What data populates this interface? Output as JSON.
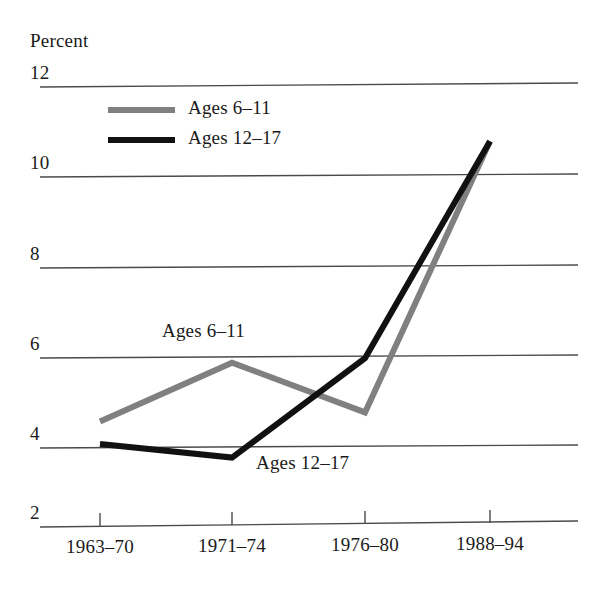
{
  "chart_data": {
    "type": "line",
    "title": "",
    "subtitle": "",
    "xlabel": "",
    "ylabel": "Percent",
    "categories": [
      "1963–70",
      "1971–74",
      "1976–80",
      "1988–94"
    ],
    "ylim": [
      2,
      12
    ],
    "yticks": [
      12,
      10,
      8,
      6,
      4,
      2
    ],
    "ytick_labels": [
      "12",
      "10",
      "8",
      "6",
      "4",
      "2"
    ],
    "grid": true,
    "grid_orientation": "horizontal",
    "legend_position": "top-left-inside",
    "series": [
      {
        "name": "Ages 6–11",
        "color": "#808080",
        "values": [
          4.6,
          5.9,
          4.8,
          10.8
        ]
      },
      {
        "name": "Ages 12–17",
        "color": "#111111",
        "values": [
          4.1,
          3.8,
          6.0,
          10.8
        ]
      }
    ],
    "annotations": [
      {
        "text": "Ages 6–11",
        "series": "Ages 6–11"
      },
      {
        "text": "Ages 12–17",
        "series": "Ages 12–17"
      }
    ]
  },
  "axis": {
    "y_unit_label": "Percent",
    "ticks_y": [
      "12",
      "10",
      "8",
      "6",
      "4",
      "2"
    ],
    "ticks_x": [
      "1963–70",
      "1971–74",
      "1976–80",
      "1988–94"
    ]
  },
  "legend": {
    "entries": [
      {
        "label": "Ages 6–11",
        "color": "#808080"
      },
      {
        "label": "Ages 12–17",
        "color": "#111111"
      }
    ]
  },
  "annotations": {
    "gray_inplot": "Ages 6–11",
    "black_inplot": "Ages 12–17"
  },
  "colors": {
    "series_gray": "#808080",
    "series_black": "#111111",
    "gridline": "#4a4a4a",
    "background": "#ffffff"
  }
}
